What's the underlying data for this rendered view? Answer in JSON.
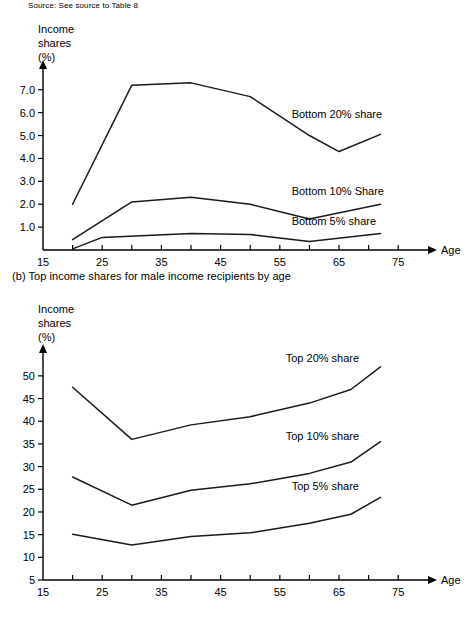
{
  "source_note": "Source: See source to Table 8",
  "panel_b_caption": "(b) Top income shares for male income recipients by age",
  "axis_titles": {
    "y_line1": "Income",
    "y_line2": "shares",
    "y_line3": "(%)",
    "x": "Age"
  },
  "chart_data": [
    {
      "type": "line",
      "id": "panel-a",
      "title": "",
      "xlabel": "Age",
      "ylabel": "Income shares (%)",
      "xlim": [
        15,
        78
      ],
      "ylim": [
        0,
        7.6
      ],
      "grid": false,
      "legend_position": "inline-right",
      "x_ticks": [
        15,
        25,
        35,
        45,
        55,
        65,
        75
      ],
      "x_tick_labels": [
        "15",
        "25",
        "35",
        "45",
        "55",
        "65",
        "75"
      ],
      "y_ticks": [
        1.0,
        2.0,
        3.0,
        4.0,
        5.0,
        6.0,
        7.0
      ],
      "y_tick_labels": [
        "1.0",
        "2.0",
        "3.0",
        "4.0",
        "5.0",
        "6.0",
        "7.0"
      ],
      "series": [
        {
          "name": "Bottom 20% share",
          "label_x": 57,
          "label_y": 5.75,
          "x": [
            20,
            30,
            40,
            50,
            60,
            65,
            72
          ],
          "values": [
            2.0,
            7.2,
            7.3,
            6.7,
            5.0,
            4.3,
            5.05
          ]
        },
        {
          "name": "Bottom 10% Share",
          "label_x": 57,
          "label_y": 2.4,
          "x": [
            20,
            30,
            40,
            50,
            60,
            72
          ],
          "values": [
            0.45,
            2.1,
            2.3,
            2.0,
            1.35,
            2.0
          ]
        },
        {
          "name": "Bottom 5% share",
          "label_x": 57,
          "label_y": 1.1,
          "x": [
            20,
            25,
            40,
            50,
            60,
            72
          ],
          "values": [
            0.05,
            0.55,
            0.72,
            0.68,
            0.37,
            0.72
          ]
        }
      ]
    },
    {
      "type": "line",
      "id": "panel-b",
      "title": "(b) Top income shares for male income recipients by age",
      "xlabel": "Age",
      "ylabel": "Income shares (%)",
      "xlim": [
        15,
        78
      ],
      "ylim": [
        5,
        53.5
      ],
      "grid": false,
      "legend_position": "inline-right",
      "x_ticks": [
        15,
        25,
        35,
        45,
        55,
        65,
        75
      ],
      "x_tick_labels": [
        "15",
        "25",
        "35",
        "45",
        "55",
        "65",
        "75"
      ],
      "y_ticks": [
        5,
        10,
        15,
        20,
        25,
        30,
        35,
        40,
        45,
        50
      ],
      "y_tick_labels": [
        "5",
        "10",
        "15",
        "20",
        "25",
        "30",
        "35",
        "40",
        "45",
        "50"
      ],
      "series": [
        {
          "name": "Top 20% share",
          "label_x": 56,
          "label_y": 53.0,
          "x": [
            20,
            30,
            40,
            50,
            60,
            67,
            72
          ],
          "values": [
            47.5,
            36.0,
            39.2,
            41.0,
            44.0,
            47.0,
            52.0
          ]
        },
        {
          "name": "Top 10% share",
          "label_x": 56,
          "label_y": 35.8,
          "x": [
            20,
            30,
            40,
            50,
            60,
            67,
            72
          ],
          "values": [
            27.7,
            21.5,
            24.8,
            26.2,
            28.5,
            31.0,
            35.5
          ]
        },
        {
          "name": "Top 5% share",
          "label_x": 57,
          "label_y": 24.8,
          "x": [
            20,
            30,
            40,
            50,
            60,
            67,
            72
          ],
          "values": [
            15.1,
            12.7,
            14.6,
            15.4,
            17.5,
            19.5,
            23.2
          ]
        }
      ]
    }
  ]
}
